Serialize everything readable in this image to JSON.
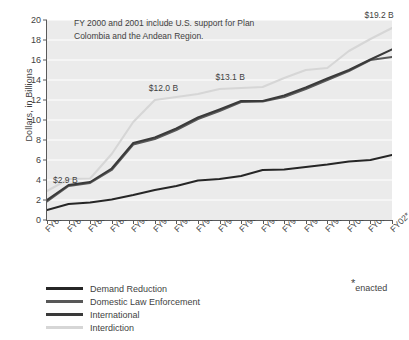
{
  "chart_data": {
    "type": "line",
    "title": "",
    "subtitle": "",
    "xlabel": "",
    "ylabel": "Dollars, in Billions",
    "ylim": [
      0,
      20
    ],
    "ytick_values": [
      0,
      2,
      4,
      6,
      8,
      10,
      12,
      14,
      16,
      18,
      20
    ],
    "grid": true,
    "grid_color": "#ffffff",
    "plot_background": "#ebebeb",
    "legend_position": "below-left",
    "stacked_cumulative": true,
    "categories": [
      "FY86",
      "FY87",
      "FY88",
      "FY89",
      "FY90",
      "FY91",
      "FY92",
      "FY93",
      "FY94",
      "FY95",
      "FY96",
      "FY97",
      "FY98",
      "FY99",
      "FY00",
      "FY01",
      "FY02"
    ],
    "series": [
      {
        "name": "Demand Reduction",
        "color": "#262626",
        "values": [
          1.0,
          1.6,
          1.75,
          2.05,
          2.5,
          3.0,
          3.4,
          3.95,
          4.1,
          4.4,
          5.0,
          5.05,
          5.3,
          5.55,
          5.85,
          6.0,
          6.5
        ]
      },
      {
        "name": "Domestic Law Enforcement",
        "color": "#585858",
        "values": [
          1.85,
          3.4,
          3.7,
          5.0,
          7.55,
          8.1,
          9.0,
          10.1,
          10.9,
          11.8,
          11.85,
          12.3,
          13.1,
          14.0,
          14.9,
          16.0,
          16.3
        ]
      },
      {
        "name": "International",
        "color": "#3a3a3a",
        "values": [
          2.0,
          3.5,
          3.8,
          5.15,
          7.7,
          8.25,
          9.15,
          10.25,
          11.05,
          11.9,
          11.9,
          12.45,
          13.25,
          14.15,
          15.0,
          16.05,
          17.05
        ]
      },
      {
        "name": "Interdiction",
        "color": "#d6d6d6",
        "values": [
          2.9,
          4.1,
          4.15,
          6.6,
          9.8,
          12.0,
          12.3,
          12.6,
          13.1,
          13.2,
          13.3,
          14.2,
          15.0,
          15.2,
          16.9,
          18.1,
          19.2
        ]
      }
    ],
    "annotations": [
      {
        "text": "$2.9 B",
        "category": "FY86",
        "value": 2.9,
        "dx": 6,
        "dy": -8
      },
      {
        "text": "$12.0 B",
        "category": "FY91",
        "value": 12.0,
        "dx": -6,
        "dy": -9
      },
      {
        "text": "$13.1 B",
        "category": "FY94",
        "value": 13.1,
        "dx": -4,
        "dy": -9
      },
      {
        "text": "$19.2 B",
        "category": "FY01",
        "value": 19.2,
        "dx": -6,
        "dy": -10
      }
    ],
    "note": "FY 2000 and 2001 include U.S. support for Plan Colombia and the Andean Region.",
    "footnote": "enacted",
    "footnote_marker": "*",
    "footnote_applies_to": "FY02"
  }
}
